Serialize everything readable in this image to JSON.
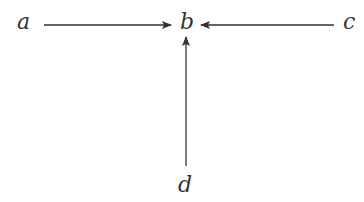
{
  "diagram": {
    "type": "directed-graph",
    "nodes": [
      {
        "id": "a",
        "label": "a"
      },
      {
        "id": "b",
        "label": "b"
      },
      {
        "id": "c",
        "label": "c"
      },
      {
        "id": "d",
        "label": "d"
      }
    ],
    "edges": [
      {
        "from": "a",
        "to": "b"
      },
      {
        "from": "c",
        "to": "b"
      },
      {
        "from": "d",
        "to": "b"
      }
    ],
    "colors": {
      "stroke": "#333333",
      "text": "#333333",
      "background": "#ffffff"
    }
  }
}
